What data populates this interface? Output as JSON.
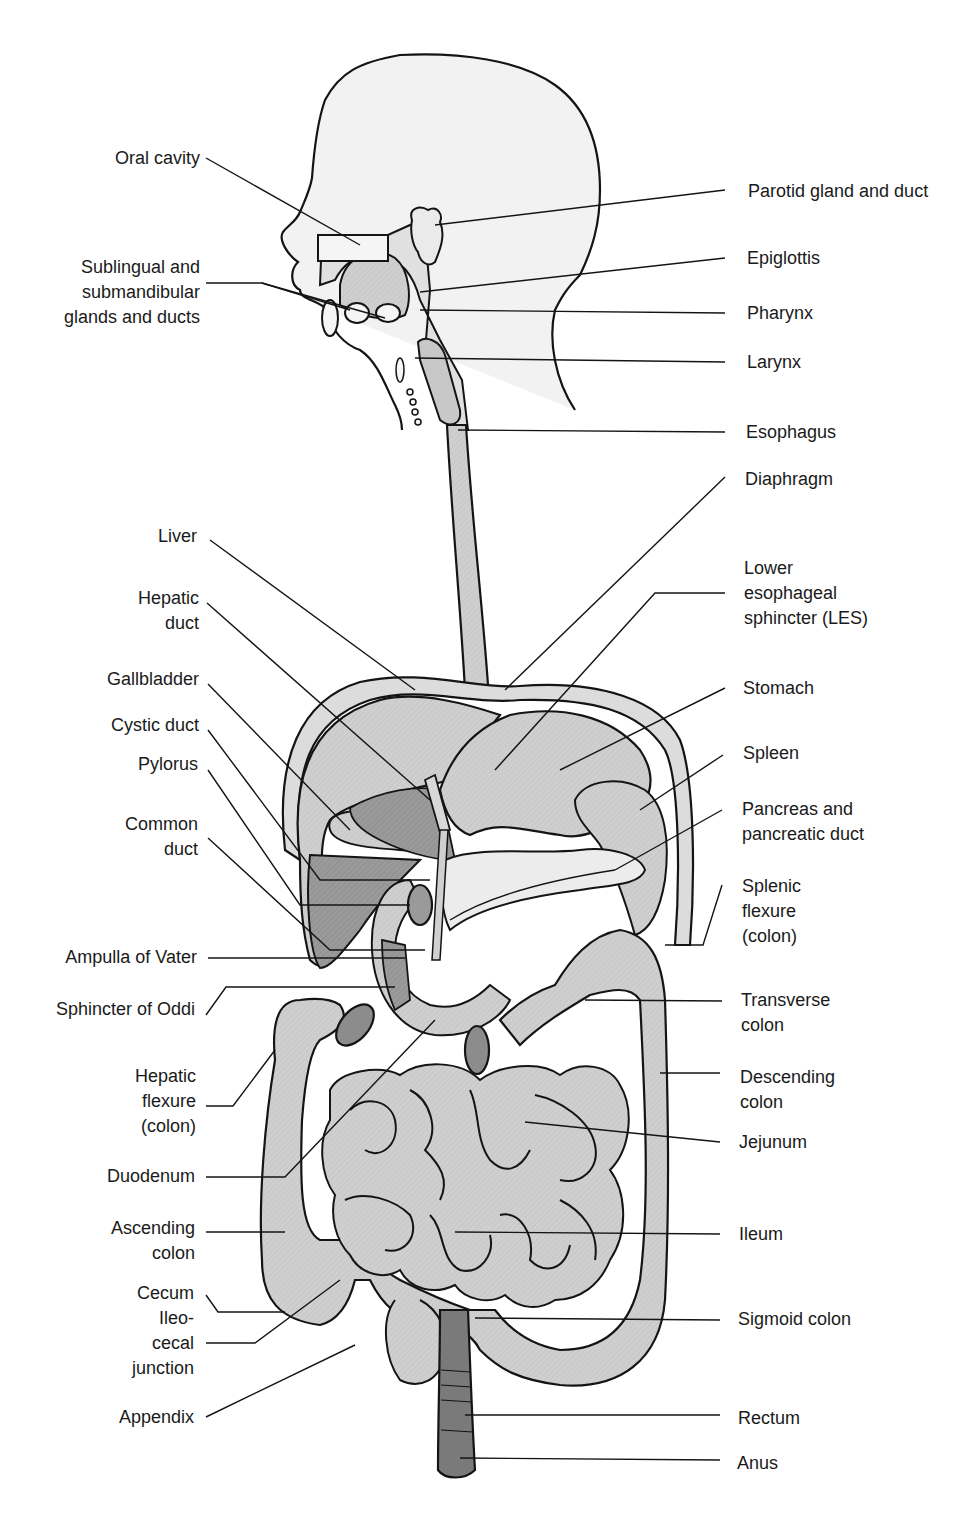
{
  "diagram": {
    "colors": {
      "background": "#ffffff",
      "outline": "#141414",
      "organ_light": "#d0d0d0",
      "organ_mid": "#b8b8b8",
      "organ_dark": "#8c8c8c",
      "rectum": "#7a7a7a",
      "head_fill": "#f2f2f2",
      "pancreas": "#e6e6e6"
    },
    "labels_left": [
      {
        "id": "oral-cavity",
        "lines": [
          "Oral cavity"
        ],
        "x": 200,
        "y": 146
      },
      {
        "id": "sublingual-submandibular",
        "lines": [
          "Sublingual and",
          "submandibular",
          "glands and ducts"
        ],
        "x": 200,
        "y": 255
      },
      {
        "id": "liver",
        "lines": [
          "Liver"
        ],
        "x": 197,
        "y": 524
      },
      {
        "id": "hepatic-duct",
        "lines": [
          "Hepatic",
          "duct"
        ],
        "x": 199,
        "y": 586
      },
      {
        "id": "gallbladder",
        "lines": [
          "Gallbladder"
        ],
        "x": 199,
        "y": 667
      },
      {
        "id": "cystic-duct",
        "lines": [
          "Cystic duct"
        ],
        "x": 199,
        "y": 713
      },
      {
        "id": "pylorus",
        "lines": [
          "Pylorus"
        ],
        "x": 198,
        "y": 752
      },
      {
        "id": "common-duct",
        "lines": [
          "Common",
          "duct"
        ],
        "x": 198,
        "y": 812
      },
      {
        "id": "ampulla-of-vater",
        "lines": [
          "Ampulla of Vater"
        ],
        "x": 197,
        "y": 945
      },
      {
        "id": "sphincter-of-oddi",
        "lines": [
          "Sphincter of Oddi"
        ],
        "x": 195,
        "y": 997
      },
      {
        "id": "hepatic-flexure",
        "lines": [
          "Hepatic",
          "flexure",
          "(colon)"
        ],
        "x": 196,
        "y": 1064
      },
      {
        "id": "duodenum",
        "lines": [
          "Duodenum"
        ],
        "x": 195,
        "y": 1164
      },
      {
        "id": "ascending-colon",
        "lines": [
          "Ascending",
          "colon"
        ],
        "x": 195,
        "y": 1216
      },
      {
        "id": "cecum",
        "lines": [
          "Cecum"
        ],
        "x": 194,
        "y": 1281
      },
      {
        "id": "ileocecal-junction",
        "lines": [
          "Ileo-",
          "cecal",
          "junction"
        ],
        "x": 194,
        "y": 1306
      },
      {
        "id": "appendix",
        "lines": [
          "Appendix"
        ],
        "x": 194,
        "y": 1405
      }
    ],
    "labels_right": [
      {
        "id": "parotid-gland",
        "lines": [
          "Parotid gland and duct"
        ],
        "x": 748,
        "y": 179
      },
      {
        "id": "epiglottis",
        "lines": [
          "Epiglottis"
        ],
        "x": 747,
        "y": 246
      },
      {
        "id": "pharynx",
        "lines": [
          "Pharynx"
        ],
        "x": 747,
        "y": 301
      },
      {
        "id": "larynx",
        "lines": [
          "Larynx"
        ],
        "x": 747,
        "y": 350
      },
      {
        "id": "esophagus",
        "lines": [
          "Esophagus"
        ],
        "x": 746,
        "y": 420
      },
      {
        "id": "diaphragm",
        "lines": [
          "Diaphragm"
        ],
        "x": 745,
        "y": 467
      },
      {
        "id": "les",
        "lines": [
          "Lower",
          "esophageal",
          "sphincter (LES)"
        ],
        "x": 744,
        "y": 556
      },
      {
        "id": "stomach",
        "lines": [
          "Stomach"
        ],
        "x": 743,
        "y": 676
      },
      {
        "id": "spleen",
        "lines": [
          "Spleen"
        ],
        "x": 743,
        "y": 741
      },
      {
        "id": "pancreas",
        "lines": [
          "Pancreas and",
          "pancreatic duct"
        ],
        "x": 742,
        "y": 797
      },
      {
        "id": "splenic-flexure",
        "lines": [
          "Splenic",
          "flexure",
          "(colon)"
        ],
        "x": 742,
        "y": 874
      },
      {
        "id": "transverse-colon",
        "lines": [
          "Transverse",
          "colon"
        ],
        "x": 741,
        "y": 988
      },
      {
        "id": "descending-colon",
        "lines": [
          "Descending",
          "colon"
        ],
        "x": 740,
        "y": 1065
      },
      {
        "id": "jejunum",
        "lines": [
          "Jejunum"
        ],
        "x": 739,
        "y": 1130
      },
      {
        "id": "ileum",
        "lines": [
          "Ileum"
        ],
        "x": 739,
        "y": 1222
      },
      {
        "id": "sigmoid-colon",
        "lines": [
          "Sigmoid colon"
        ],
        "x": 738,
        "y": 1307
      },
      {
        "id": "rectum",
        "lines": [
          "Rectum"
        ],
        "x": 738,
        "y": 1406
      },
      {
        "id": "anus",
        "lines": [
          "Anus"
        ],
        "x": 737,
        "y": 1451
      }
    ],
    "leader_lines": [
      {
        "to": "oral-cavity",
        "points": "206,158 360,245"
      },
      {
        "to": "sublingual-submandibular",
        "points": "206,283 262,283 350,310"
      },
      {
        "to": "sublingual-submandibular-2",
        "points": "262,283 385,318"
      },
      {
        "to": "parotid-gland",
        "points": "725,190 435,225"
      },
      {
        "to": "epiglottis",
        "points": "725,258 420,292"
      },
      {
        "to": "pharynx",
        "points": "725,313 420,310"
      },
      {
        "to": "larynx",
        "points": "725,362 415,358"
      },
      {
        "to": "esophagus",
        "points": "725,432 458,430"
      },
      {
        "to": "diaphragm",
        "points": "725,477 505,690"
      },
      {
        "to": "liver",
        "points": "210,540 415,690"
      },
      {
        "to": "hepatic-duct",
        "points": "207,603 430,800"
      },
      {
        "to": "les",
        "points": "725,593 655,593 495,770"
      },
      {
        "to": "gallbladder",
        "points": "208,684 350,830"
      },
      {
        "to": "cystic-duct",
        "points": "208,730 320,880 430,880"
      },
      {
        "to": "stomach",
        "points": "725,688 560,770"
      },
      {
        "to": "pylorus",
        "points": "208,770 300,905 410,905"
      },
      {
        "to": "spleen",
        "points": "723,755 640,810"
      },
      {
        "to": "common-duct",
        "points": "208,838 330,950 425,950"
      },
      {
        "to": "pancreas",
        "points": "722,810 615,870"
      },
      {
        "to": "splenic-flexure",
        "points": "722,885 703,945 665,945"
      },
      {
        "to": "ampulla-of-vater",
        "points": "208,958 405,958"
      },
      {
        "to": "sphincter-of-oddi",
        "points": "206,1015 226,987 395,987"
      },
      {
        "to": "transverse-colon",
        "points": "722,1001 585,1000"
      },
      {
        "to": "hepatic-flexure",
        "points": "206,1106 233,1106 275,1050"
      },
      {
        "to": "descending-colon",
        "points": "720,1073 660,1073"
      },
      {
        "to": "duodenum",
        "points": "206,1177 285,1177 435,1020"
      },
      {
        "to": "jejunum",
        "points": "720,1142 525,1122"
      },
      {
        "to": "ascending-colon",
        "points": "206,1232 285,1232"
      },
      {
        "to": "ileum",
        "points": "720,1234 455,1232"
      },
      {
        "to": "cecum",
        "points": "206,1295 218,1312 285,1312"
      },
      {
        "to": "ileocecal-junction",
        "points": "206,1343 255,1343 340,1280"
      },
      {
        "to": "sigmoid-colon",
        "points": "720,1320 475,1318"
      },
      {
        "to": "appendix",
        "points": "206,1417 355,1345"
      },
      {
        "to": "rectum",
        "points": "720,1415 465,1415"
      },
      {
        "to": "anus",
        "points": "720,1460 460,1458"
      }
    ]
  }
}
